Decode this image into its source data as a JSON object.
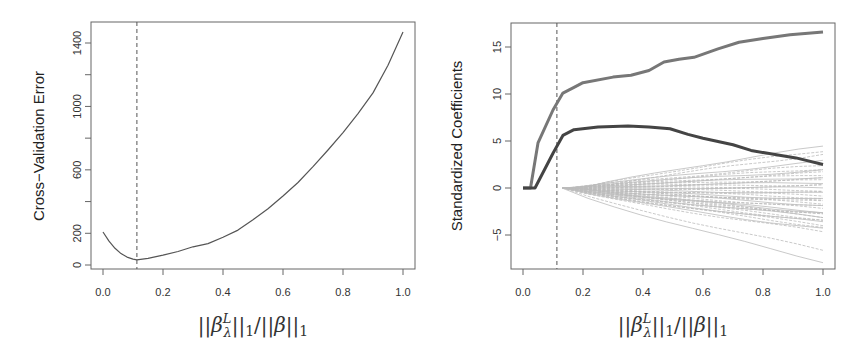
{
  "chart_data": [
    {
      "type": "line",
      "title": "",
      "xlabel": "||β̂^L_λ||₁/||β̂||₁",
      "ylabel": "Cross−Validation Error",
      "xlim": [
        0.0,
        1.0
      ],
      "ylim": [
        0,
        1400
      ],
      "grid": false,
      "legend": null,
      "x_ticks": [
        0.0,
        0.2,
        0.4,
        0.6,
        0.8,
        1.0
      ],
      "x_tick_labels": [
        "0.0",
        "0.2",
        "0.4",
        "0.6",
        "0.8",
        "1.0"
      ],
      "y_ticks": [
        0,
        200,
        400,
        600,
        800,
        1000,
        1200,
        1400
      ],
      "y_tick_labels": [
        "0",
        "200",
        "",
        "600",
        "",
        "1000",
        "",
        "1400"
      ],
      "vline": {
        "x": 0.113,
        "style": "dashed"
      },
      "series": [
        {
          "name": "CV error",
          "color": "#555555",
          "x": [
            0.0,
            0.02,
            0.04,
            0.06,
            0.08,
            0.1,
            0.113,
            0.15,
            0.2,
            0.25,
            0.3,
            0.35,
            0.4,
            0.45,
            0.5,
            0.55,
            0.6,
            0.65,
            0.7,
            0.75,
            0.8,
            0.85,
            0.9,
            0.95,
            1.0
          ],
          "y": [
            208,
            150,
            105,
            72,
            50,
            37,
            32,
            42,
            62,
            85,
            115,
            135,
            175,
            220,
            285,
            355,
            435,
            520,
            620,
            725,
            835,
            955,
            1085,
            1260,
            1469
          ]
        }
      ]
    },
    {
      "type": "line",
      "title": "",
      "xlabel": "||β̂^L_λ||₁/||β̂||₁",
      "ylabel": "Standardized Coefficients",
      "xlim": [
        0.0,
        1.0
      ],
      "ylim": [
        -8,
        17
      ],
      "grid": false,
      "legend": null,
      "x_ticks": [
        0.0,
        0.2,
        0.4,
        0.6,
        0.8,
        1.0
      ],
      "x_tick_labels": [
        "0.0",
        "0.2",
        "0.4",
        "0.6",
        "0.8",
        "1.0"
      ],
      "y_ticks": [
        -5,
        0,
        5,
        10,
        15
      ],
      "y_tick_labels": [
        "−5",
        "0",
        "5",
        "10",
        "15"
      ],
      "vline": {
        "x": 0.113,
        "style": "dashed"
      },
      "series": [
        {
          "name": "signal-1",
          "color": "#777777",
          "width": 3,
          "x": [
            0.0,
            0.025,
            0.05,
            0.1,
            0.133,
            0.17,
            0.2,
            0.3,
            0.36,
            0.42,
            0.47,
            0.52,
            0.57,
            0.65,
            0.72,
            0.8,
            0.89,
            1.0
          ],
          "y": [
            0,
            0,
            4.8,
            8.3,
            10.1,
            10.7,
            11.2,
            11.8,
            12.0,
            12.5,
            13.4,
            13.7,
            13.9,
            14.8,
            15.5,
            15.9,
            16.3,
            16.6
          ]
        },
        {
          "name": "signal-2",
          "color": "#444444",
          "width": 3,
          "x": [
            0.0,
            0.04,
            0.1,
            0.133,
            0.17,
            0.25,
            0.35,
            0.42,
            0.49,
            0.55,
            0.6,
            0.7,
            0.76,
            0.85,
            0.91,
            1.0
          ],
          "y": [
            0,
            0,
            3.7,
            5.6,
            6.2,
            6.5,
            6.6,
            6.5,
            6.3,
            5.7,
            5.3,
            4.6,
            4.0,
            3.5,
            3.2,
            2.5
          ]
        }
      ],
      "noise_series": {
        "color": "#bbbbbb",
        "start_x": 0.13,
        "count": 43,
        "end_values_at_1": [
          4.4,
          4.0,
          3.6,
          2.8,
          2.4,
          2.1,
          1.9,
          1.6,
          1.4,
          1.2,
          1.0,
          0.8,
          0.6,
          0.4,
          0.2,
          0.0,
          -0.2,
          -0.4,
          -0.6,
          -0.8,
          -1.0,
          -1.2,
          -1.4,
          -1.6,
          -1.8,
          -2.0,
          -2.2,
          -2.5,
          -2.7,
          -2.9,
          -3.1,
          -3.3,
          -3.5,
          -3.7,
          -3.9,
          -4.1,
          -4.4,
          -4.7,
          -3.0,
          -2.6,
          -1.5,
          -6.6,
          -7.8
        ],
        "start_offsets": [
          0.3,
          0.28,
          0.4,
          0.22,
          0.18,
          0.25,
          0.15,
          0.2,
          0.17,
          0.14,
          0.16,
          0.19,
          0.13,
          0.21,
          0.15,
          0.18,
          0.14,
          0.16,
          0.17,
          0.13,
          0.2,
          0.15,
          0.18,
          0.14,
          0.19,
          0.16,
          0.17,
          0.14,
          0.15,
          0.18,
          0.16,
          0.13,
          0.17,
          0.15,
          0.14,
          0.16,
          0.14,
          0.13,
          0.3,
          0.25,
          0.22,
          0.14,
          0.13
        ]
      }
    }
  ],
  "panels": {
    "left": {
      "ylabel": "Cross−Validation Error"
    },
    "right": {
      "ylabel": "Standardized Coefficients"
    }
  },
  "xlabel_parts": {
    "beta": "β",
    "hat": "^",
    "sup": "L",
    "sub": "λ",
    "norm": "||",
    "one": "1",
    "slash": "/"
  }
}
